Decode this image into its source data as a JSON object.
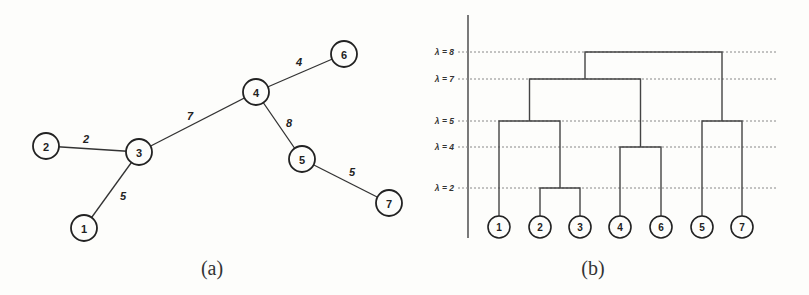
{
  "panel_a": {
    "caption": "(a)",
    "nodes": [
      {
        "id": "1",
        "x": 84,
        "y": 228
      },
      {
        "id": "2",
        "x": 46,
        "y": 146
      },
      {
        "id": "3",
        "x": 139,
        "y": 152
      },
      {
        "id": "4",
        "x": 256,
        "y": 92
      },
      {
        "id": "5",
        "x": 302,
        "y": 159
      },
      {
        "id": "6",
        "x": 344,
        "y": 54
      },
      {
        "id": "7",
        "x": 389,
        "y": 203
      }
    ],
    "edges": [
      {
        "from": "2",
        "to": "3",
        "weight": "2",
        "lx": 86,
        "ly": 139
      },
      {
        "from": "3",
        "to": "1",
        "weight": "5",
        "lx": 123,
        "ly": 196
      },
      {
        "from": "3",
        "to": "4",
        "weight": "7",
        "lx": 190,
        "ly": 116
      },
      {
        "from": "4",
        "to": "6",
        "weight": "4",
        "lx": 299,
        "ly": 62
      },
      {
        "from": "4",
        "to": "5",
        "weight": "8",
        "lx": 289,
        "ly": 123
      },
      {
        "from": "5",
        "to": "7",
        "weight": "5",
        "lx": 352,
        "ly": 172
      }
    ]
  },
  "panel_b": {
    "caption": "(b)",
    "levels": [
      {
        "label": "λ = 8",
        "value": 8,
        "y": 52
      },
      {
        "label": "λ = 7",
        "value": 7,
        "y": 79
      },
      {
        "label": "λ = 5",
        "value": 5,
        "y": 121
      },
      {
        "label": "λ = 4",
        "value": 4,
        "y": 147
      },
      {
        "label": "λ = 2",
        "value": 2,
        "y": 188
      }
    ],
    "leaves": [
      {
        "id": "1",
        "x": 499
      },
      {
        "id": "2",
        "x": 540
      },
      {
        "id": "3",
        "x": 580
      },
      {
        "id": "4",
        "x": 620
      },
      {
        "id": "6",
        "x": 661
      },
      {
        "id": "5",
        "x": 702
      },
      {
        "id": "7",
        "x": 742
      }
    ],
    "merges": [
      {
        "members": [
          "2",
          "3"
        ],
        "level": 2
      },
      {
        "members": [
          "4",
          "6"
        ],
        "level": 4
      },
      {
        "members": [
          "1",
          "2,3"
        ],
        "level": 5
      },
      {
        "members": [
          "5",
          "7"
        ],
        "level": 5
      },
      {
        "members": [
          "1,2,3",
          "4,6"
        ],
        "level": 7
      },
      {
        "members": [
          "1,2,3,4,6",
          "5,7"
        ],
        "level": 8
      }
    ]
  }
}
